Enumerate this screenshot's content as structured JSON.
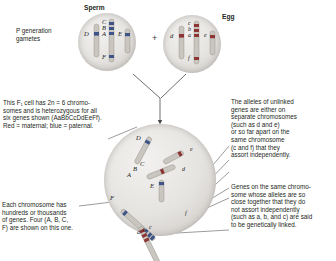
{
  "figure": {
    "title_sperm": "Sperm",
    "title_egg": "Egg",
    "p_generation_label": "P generation\ngametes",
    "plus_sign": "+"
  },
  "callouts": {
    "f1_description": "This F₁ cell has 2n = 6 chromo-\nsomes and is heterozygous for all\nsix genes shown (AaBbCcDdEeFf).\nRed = maternal; blue = paternal.",
    "f1_genotype": "AaBbCcDdEeFf",
    "unlinked_genes": "The alleles of unlinked\ngenes are either on\nseparate chromosomes\n(such as d and e)\nor so far apart on the\nsame chromosome\n(c and f) that they\nassort independently.",
    "linked_genes": "Genes on the same chromo-\nsome whose alleles are so\nclose together that they do\nnot assort independently\n(such as a, b, and c) are said\nto be genetically linked.",
    "chromosome_genes": "Each chromosome has\nhundreds or thousands\nof genes. Four (A, B, C,\nF) are shown on this one."
  },
  "sperm_cell": {
    "name": "sperm-cell",
    "chromosome_labels": [
      "D",
      "C",
      "B",
      "A",
      "F",
      "E"
    ],
    "color": "#4a5f8f",
    "source": "paternal"
  },
  "egg_cell": {
    "name": "egg-cell",
    "chromosome_labels": [
      "d",
      "c",
      "b",
      "a",
      "f",
      "e"
    ],
    "color": "#9a3b3b",
    "source": "maternal"
  },
  "f1_cell": {
    "name": "f1-cell",
    "chromosome_count": 6,
    "ploidy": "2n = 6",
    "paternal_labels": [
      "D",
      "C",
      "B",
      "A",
      "F",
      "E"
    ],
    "maternal_labels": [
      "d",
      "c",
      "b",
      "a",
      "f",
      "e"
    ]
  },
  "colors": {
    "maternal": "#9a3b3b",
    "paternal": "#4a5f8f",
    "chromosome_body": "#b8b4ae",
    "text": "#231f20",
    "leader_line": "#4a4a4a"
  }
}
